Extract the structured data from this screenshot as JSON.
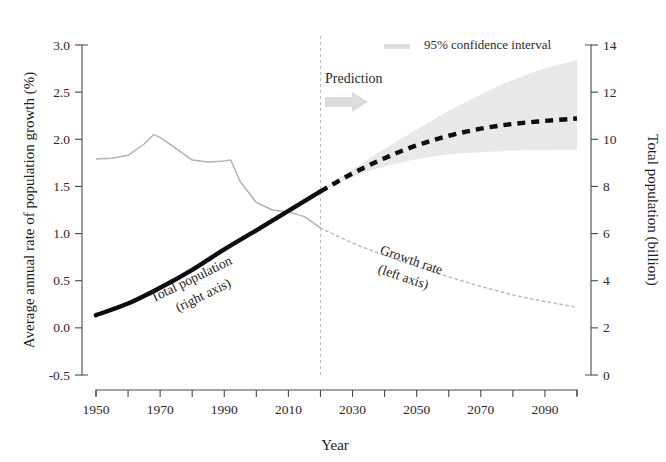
{
  "figure": {
    "background": "#ffffff",
    "ink_color": "#231f20"
  },
  "chart_data": {
    "type": "line",
    "title": "",
    "xlabel": "Year",
    "ylabel": "Average annual rate of population growth (%)",
    "y2label": "Total population (billion)",
    "xlim": [
      1950,
      2100
    ],
    "ylim": [
      -0.5,
      3.0
    ],
    "y2lim": [
      0,
      14
    ],
    "grid": false,
    "x_major_ticks": [
      1950,
      1970,
      1990,
      2010,
      2030,
      2050,
      2070,
      2090
    ],
    "x_minor_ticks": [
      1960,
      1980,
      2000,
      2020,
      2040,
      2060,
      2080,
      2100
    ],
    "x_tick_labels": [
      "1950",
      "1970",
      "1990",
      "2010",
      "2030",
      "2050",
      "2070",
      "2090"
    ],
    "y_ticks": [
      -0.5,
      0.0,
      0.5,
      1.0,
      1.5,
      2.0,
      2.5,
      3.0
    ],
    "y_tick_labels": [
      "-0.5",
      "0.0",
      "0.5",
      "1.0",
      "1.5",
      "2.0",
      "2.5",
      "3.0"
    ],
    "y2_ticks": [
      0,
      2,
      4,
      6,
      8,
      10,
      12,
      14
    ],
    "y2_tick_labels": [
      "0",
      "2",
      "4",
      "6",
      "8",
      "10",
      "12",
      "14"
    ],
    "prediction_divider_year": 2020,
    "legend": {
      "position": "top-right",
      "entries": [
        {
          "label": "95% confidence interval",
          "color": "#e2e2e2",
          "marker": "band"
        }
      ]
    },
    "annotations": [
      {
        "text": "Prediction",
        "x": 2021,
        "y": 2.42,
        "arrow": "right"
      },
      {
        "text": "Total population",
        "sub": "(right axis)",
        "x": 1988,
        "y": 0.72,
        "rotation": -26
      },
      {
        "text": "Growth rate",
        "sub": "(left axis)",
        "x": 2046,
        "y": 0.7,
        "rotation": 19
      }
    ],
    "series": [
      {
        "name": "Growth rate (left axis)",
        "axis": "left",
        "style": "solid",
        "color": "#b3b3b3",
        "segment": "historical",
        "x": [
          1950,
          1955,
          1960,
          1965,
          1968,
          1970,
          1975,
          1980,
          1985,
          1990,
          1992,
          1995,
          2000,
          2005,
          2010,
          2015,
          2020
        ],
        "y": [
          1.79,
          1.8,
          1.83,
          1.95,
          2.05,
          2.02,
          1.9,
          1.78,
          1.76,
          1.77,
          1.78,
          1.55,
          1.33,
          1.25,
          1.23,
          1.18,
          1.06
        ]
      },
      {
        "name": "Growth rate (left axis) projected",
        "axis": "left",
        "style": "dotted",
        "color": "#b3b3b3",
        "segment": "prediction",
        "x": [
          2020,
          2030,
          2040,
          2050,
          2060,
          2070,
          2080,
          2090,
          2100
        ],
        "y": [
          1.06,
          0.9,
          0.77,
          0.65,
          0.54,
          0.44,
          0.35,
          0.28,
          0.22
        ]
      },
      {
        "name": "Total population (right axis)",
        "axis": "right",
        "style": "solid-thick",
        "color": "#111111",
        "segment": "historical",
        "x": [
          1950,
          1960,
          1970,
          1980,
          1990,
          2000,
          2010,
          2020
        ],
        "y": [
          2.54,
          3.03,
          3.7,
          4.46,
          5.33,
          6.14,
          6.96,
          7.79
        ]
      },
      {
        "name": "Total population (right axis) projected",
        "axis": "right",
        "style": "dashed-thick",
        "color": "#111111",
        "segment": "prediction",
        "x": [
          2020,
          2030,
          2040,
          2050,
          2060,
          2070,
          2080,
          2090,
          2100
        ],
        "y": [
          7.79,
          8.55,
          9.2,
          9.74,
          10.15,
          10.45,
          10.65,
          10.78,
          10.88
        ]
      },
      {
        "name": "95% confidence interval upper",
        "axis": "right",
        "style": "band",
        "color": "#e6e6e6",
        "segment": "prediction",
        "x": [
          2020,
          2030,
          2040,
          2050,
          2060,
          2070,
          2080,
          2090,
          2100
        ],
        "y": [
          7.79,
          8.72,
          9.6,
          10.42,
          11.2,
          11.9,
          12.52,
          13.0,
          13.35
        ]
      },
      {
        "name": "95% confidence interval lower",
        "axis": "right",
        "style": "band",
        "color": "#e6e6e6",
        "segment": "prediction",
        "x": [
          2020,
          2030,
          2040,
          2050,
          2060,
          2070,
          2080,
          2090,
          2100
        ],
        "y": [
          7.79,
          8.4,
          8.85,
          9.15,
          9.35,
          9.45,
          9.52,
          9.55,
          9.55
        ]
      }
    ]
  }
}
